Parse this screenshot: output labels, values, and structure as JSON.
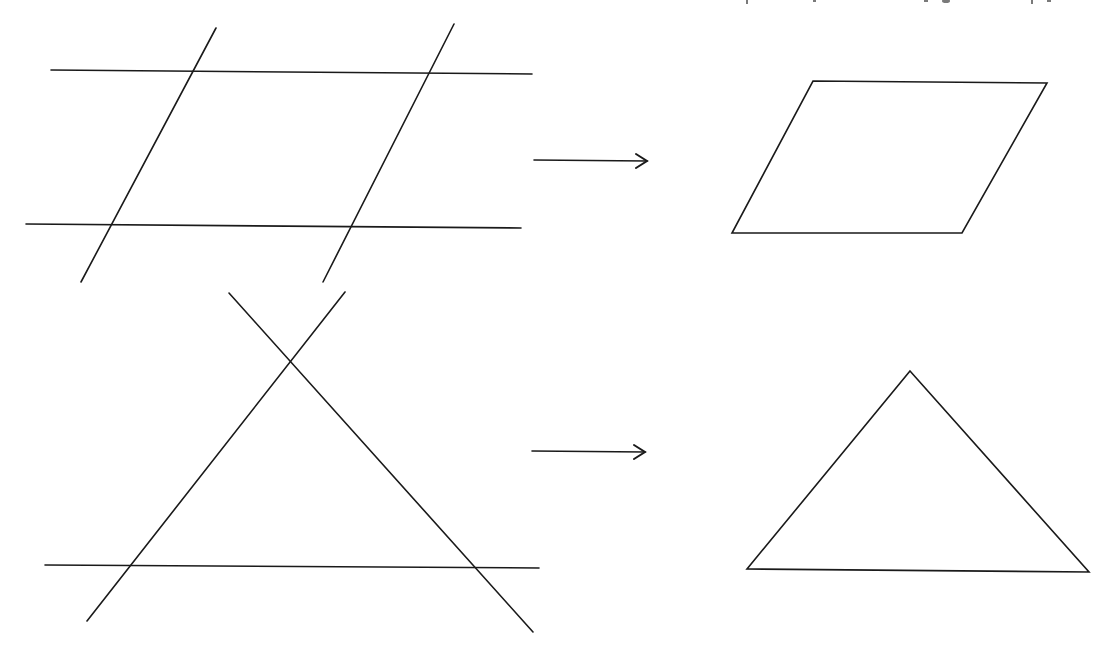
{
  "diagram": {
    "colors": {
      "background": "#ffffff",
      "stroke": "#1a1a1a"
    },
    "rows": [
      {
        "name": "parallelogram-row",
        "source_lines": [
          {
            "name": "top-horizontal-line",
            "x1": 51,
            "y1": 70,
            "x2": 532,
            "y2": 74
          },
          {
            "name": "bottom-horizontal-line",
            "x1": 26,
            "y1": 224,
            "x2": 521,
            "y2": 228
          },
          {
            "name": "left-slanted-line",
            "x1": 216,
            "y1": 28,
            "x2": 81,
            "y2": 282
          },
          {
            "name": "right-slanted-line",
            "x1": 454,
            "y1": 24,
            "x2": 323,
            "y2": 282
          }
        ],
        "arrow": {
          "x1": 534,
          "y1": 160,
          "x2": 647,
          "y2": 161
        },
        "result_shape": {
          "type": "parallelogram",
          "points": [
            [
              813,
              81
            ],
            [
              1047,
              83
            ],
            [
              962,
              233
            ],
            [
              732,
              233
            ]
          ]
        }
      },
      {
        "name": "triangle-row",
        "source_lines": [
          {
            "name": "horizontal-line",
            "x1": 45,
            "y1": 565,
            "x2": 539,
            "y2": 568
          },
          {
            "name": "rising-line",
            "x1": 87,
            "y1": 621,
            "x2": 345,
            "y2": 292
          },
          {
            "name": "falling-line",
            "x1": 229,
            "y1": 293,
            "x2": 533,
            "y2": 632
          }
        ],
        "arrow": {
          "x1": 532,
          "y1": 451,
          "x2": 645,
          "y2": 452
        },
        "result_shape": {
          "type": "triangle",
          "points": [
            [
              910,
              371
            ],
            [
              1089,
              572
            ],
            [
              747,
              569
            ]
          ]
        }
      }
    ]
  }
}
